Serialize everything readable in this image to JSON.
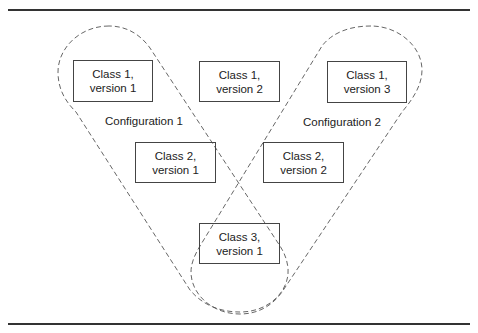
{
  "diagram": {
    "boxes": [
      {
        "id": "c1v1",
        "line1": "Class 1,",
        "line2": "version 1"
      },
      {
        "id": "c1v2",
        "line1": "Class 1,",
        "line2": "version 2"
      },
      {
        "id": "c1v3",
        "line1": "Class 1,",
        "line2": "version 3"
      },
      {
        "id": "c2v1",
        "line1": "Class 2,",
        "line2": "version 1"
      },
      {
        "id": "c2v2",
        "line1": "Class 2,",
        "line2": "version 2"
      },
      {
        "id": "c3v1",
        "line1": "Class 3,",
        "line2": "version 1"
      }
    ],
    "configurations": [
      {
        "label": "Configuration 1",
        "members": [
          "Class 1, version 1",
          "Class 2, version 1",
          "Class 3, version 1"
        ]
      },
      {
        "label": "Configuration 2",
        "members": [
          "Class 1, version 3",
          "Class 2, version 2",
          "Class 3, version 1"
        ]
      }
    ],
    "colors": {
      "line": "#333333",
      "dash": "#555555",
      "background": "#ffffff"
    }
  }
}
